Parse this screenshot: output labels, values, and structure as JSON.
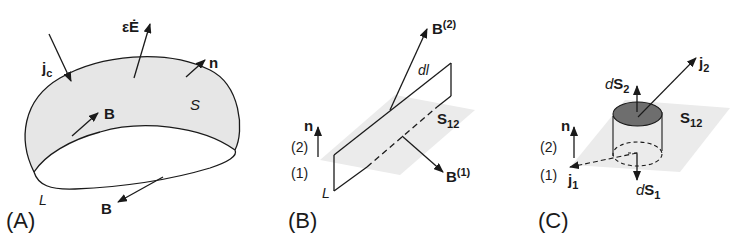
{
  "figure": {
    "panels": [
      {
        "id": "A",
        "label": "(A)",
        "labels": {
          "current": "j",
          "current_sub": "c",
          "displacement": "εĖ",
          "normal": "n",
          "surface": "S",
          "field_top": "B",
          "field_bottom": "B",
          "loop": "L"
        }
      },
      {
        "id": "B",
        "label": "(B)",
        "labels": {
          "field_2": "B",
          "field_2_sup": "(2)",
          "field_1": "B",
          "field_1_sup": "(1)",
          "element": "dl",
          "interface": "S",
          "interface_sub": "12",
          "normal": "n",
          "medium_2": "(2)",
          "medium_1": "(1)",
          "loop": "L"
        }
      },
      {
        "id": "C",
        "label": "(C)",
        "labels": {
          "current_2": "j",
          "current_2_sub": "2",
          "current_1": "j",
          "current_1_sub": "1",
          "ds2_d": "d",
          "ds2_s": "S",
          "ds2_sub": "2",
          "ds1_d": "d",
          "ds1_s": "S",
          "ds1_sub": "1",
          "interface": "S",
          "interface_sub": "12",
          "normal": "n",
          "medium_2": "(2)",
          "medium_1": "(1)"
        }
      }
    ],
    "colors": {
      "line": "#1a1a1a",
      "surface_fill": "#e6e6e6",
      "plane_fill": "#ebebeb",
      "cap_fill": "#6e6e6e"
    }
  }
}
